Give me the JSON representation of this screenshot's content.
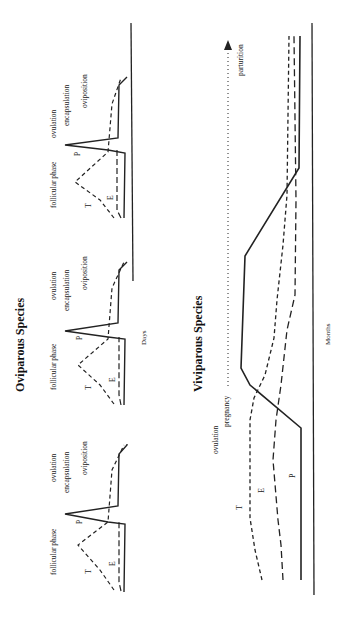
{
  "oviparous": {
    "title": "Oviparous   Species",
    "x_axis_label": "Days",
    "cycles": [
      {
        "follicular": "follicular phase",
        "ovulation": "ovulation",
        "encapsulation": "encapsulation",
        "oviposition": "oviposition",
        "P": "P",
        "T": "T",
        "E": "E"
      },
      {
        "follicular": "follicular phase",
        "ovulation": "ovulation",
        "encapsulation": "encapsulation",
        "oviposition": "oviposition",
        "P": "P",
        "T": "T",
        "E": "E"
      },
      {
        "follicular": "follicular phase",
        "ovulation": "ovulation",
        "encapsulation": "encapsulation",
        "oviposition": "oviposition",
        "P": "P",
        "T": "T",
        "E": "E"
      }
    ]
  },
  "viviparous": {
    "title": "Viviparous   Species",
    "x_axis_label": "Months",
    "ovulation": "ovulation",
    "pregnancy": "pregnancy",
    "parturition": "parturition",
    "P": "P",
    "T": "T",
    "E": "E"
  },
  "legend": {
    "P": "progesterone (solid line)",
    "T": "testosterone (short dash)",
    "E": "estrogen (long dash)"
  }
}
